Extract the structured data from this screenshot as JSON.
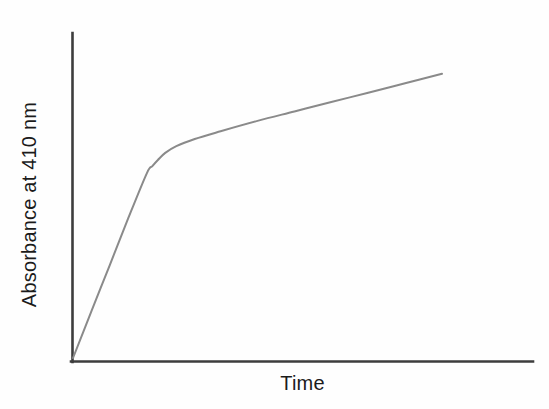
{
  "figure": {
    "background_color": "#fefefe",
    "axis_color": "#3d3d3d",
    "curve_color": "#8a8a8a",
    "text_color": "#1b1b1b"
  },
  "chart_data": {
    "type": "line",
    "title": "",
    "subtitle": "",
    "xlabel": "Time",
    "ylabel": "Absorbance at 410 nm",
    "xlim": [
      0,
      100
    ],
    "ylim": [
      0,
      100
    ],
    "grid": false,
    "legend": null,
    "legend_position": "none",
    "xticks": [],
    "yticks": [],
    "xticklabels": [],
    "yticklabels": [],
    "annotations": [],
    "series": [
      {
        "name": "Absorbance at 410 nm",
        "color": "#8a8a8a",
        "line_width": 2,
        "marker": "none",
        "description": "Biphasic progress curve: steep initial linear phase followed by a rounded transition and a slower, nearly linear steady-state phase.",
        "x": [
          0,
          5,
          10,
          15,
          20,
          21.5,
          23,
          25,
          28,
          33,
          40,
          50,
          60,
          70,
          80,
          90,
          100
        ],
        "y": [
          0,
          15.8,
          31.5,
          47.3,
          62.4,
          64.8,
          66.9,
          69.3,
          71.6,
          74.0,
          76.6,
          80.1,
          83.3,
          86.5,
          89.6,
          92.8,
          96.0
        ]
      }
    ],
    "phases": [
      {
        "name": "initial-linear-phase",
        "x_range": [
          0,
          20
        ],
        "slope_relative": "steep"
      },
      {
        "name": "transition-knee",
        "x_range": [
          20,
          28
        ],
        "slope_relative": "rounding"
      },
      {
        "name": "steady-state-phase",
        "x_range": [
          28,
          100
        ],
        "slope_relative": "shallow"
      }
    ]
  },
  "axes": {
    "y_axis_name": "vertical-axis-line",
    "x_axis_name": "horizontal-axis-line"
  }
}
